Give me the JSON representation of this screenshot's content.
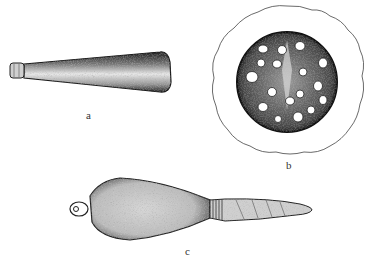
{
  "figure": {
    "panels": [
      {
        "id": "a",
        "label": "a",
        "subject": "tapered-cylindrical-object",
        "label_pos": [
          86,
          110
        ]
      },
      {
        "id": "b",
        "label": "b",
        "subject": "perforated-disc-cross-section",
        "label_pos": [
          286,
          160
        ]
      },
      {
        "id": "c",
        "label": "c",
        "subject": "bulbous-object-with-ringed-tapered-stem",
        "label_pos": [
          185,
          246
        ]
      }
    ],
    "colors": {
      "ink": "#1a1a1a",
      "stipple_mid": "#8a8a8a",
      "paper": "#ffffff"
    }
  }
}
